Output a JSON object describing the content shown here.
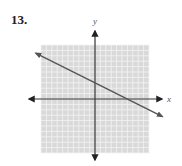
{
  "problem": {
    "number": "13."
  },
  "chart_data": {
    "type": "line",
    "title": "",
    "xlabel": "x",
    "ylabel": "y",
    "xlim": [
      -10,
      10
    ],
    "ylim": [
      -10,
      10
    ],
    "grid": true,
    "ticks_labeled": false,
    "series": [
      {
        "name": "line",
        "equation": "y = -1/2 x + 3",
        "slope": -0.5,
        "y_intercept": 3,
        "x_intercept": 6,
        "x": [
          -11,
          12.5
        ],
        "y": [
          8.5,
          -3.25
        ],
        "arrows_both_ends": true
      }
    ]
  },
  "colors": {
    "grid_bg": "#d9d9d9",
    "grid_line": "#f4f4f4",
    "axis": "#333333",
    "line": "#555555"
  }
}
